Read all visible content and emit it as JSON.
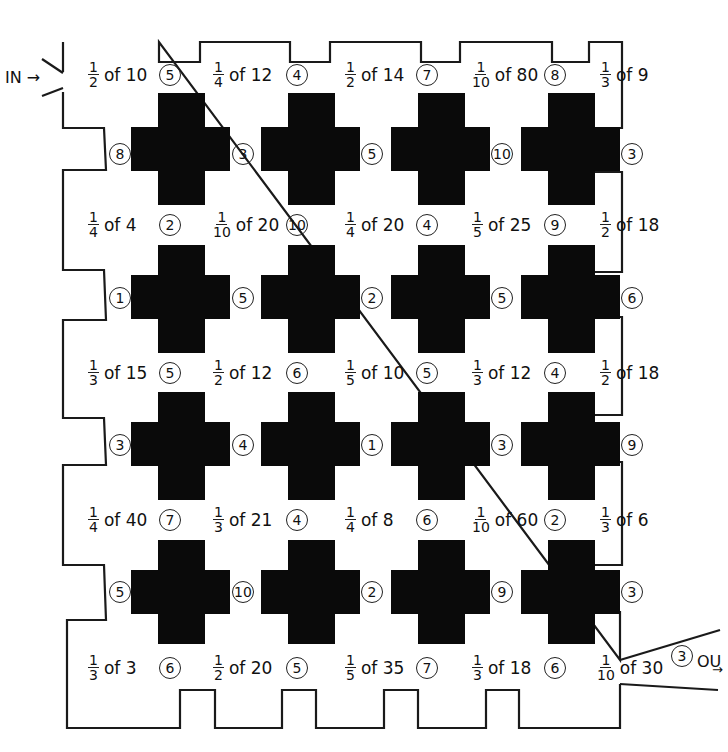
{
  "puzzle": {
    "entry_label": "IN →",
    "exit_label": "OU",
    "exit_arrow": "→",
    "fraction_rows": [
      [
        {
          "num": "1",
          "den": "2",
          "of": "of 10"
        },
        {
          "num": "1",
          "den": "4",
          "of": "of 12"
        },
        {
          "num": "1",
          "den": "2",
          "of": "of 14"
        },
        {
          "num": "1",
          "den": "10",
          "of": "of 80"
        },
        {
          "num": "1",
          "den": "3",
          "of": "of 9"
        }
      ],
      [
        {
          "num": "1",
          "den": "4",
          "of": "of 4"
        },
        {
          "num": "1",
          "den": "10",
          "of": "of 20"
        },
        {
          "num": "1",
          "den": "4",
          "of": "of 20"
        },
        {
          "num": "1",
          "den": "5",
          "of": "of 25"
        },
        {
          "num": "1",
          "den": "2",
          "of": "of 18"
        }
      ],
      [
        {
          "num": "1",
          "den": "3",
          "of": "of 15"
        },
        {
          "num": "1",
          "den": "2",
          "of": "of 12"
        },
        {
          "num": "1",
          "den": "5",
          "of": "of 10"
        },
        {
          "num": "1",
          "den": "3",
          "of": "of 12"
        },
        {
          "num": "1",
          "den": "2",
          "of": "of 18"
        }
      ],
      [
        {
          "num": "1",
          "den": "4",
          "of": "of 40"
        },
        {
          "num": "1",
          "den": "3",
          "of": "of 21"
        },
        {
          "num": "1",
          "den": "4",
          "of": "of 8"
        },
        {
          "num": "1",
          "den": "10",
          "of": "of 60"
        },
        {
          "num": "1",
          "den": "3",
          "of": "of 6"
        }
      ],
      [
        {
          "num": "1",
          "den": "3",
          "of": "of 3"
        },
        {
          "num": "1",
          "den": "2",
          "of": "of 20"
        },
        {
          "num": "1",
          "den": "5",
          "of": "of 35"
        },
        {
          "num": "1",
          "den": "3",
          "of": "of 18"
        },
        {
          "num": "1",
          "den": "10",
          "of": "of 30"
        }
      ]
    ],
    "horizontal_circles": [
      [
        "5",
        "4",
        "7",
        "8"
      ],
      [
        "2",
        "10",
        "4",
        "9"
      ],
      [
        "5",
        "6",
        "5",
        "4"
      ],
      [
        "7",
        "4",
        "6",
        "2"
      ],
      [
        "6",
        "5",
        "7",
        "6",
        "3"
      ]
    ],
    "vertical_circles": [
      [
        "8",
        "3",
        "5",
        "10",
        "3"
      ],
      [
        "1",
        "5",
        "2",
        "5",
        "6"
      ],
      [
        "3",
        "4",
        "1",
        "3",
        "9"
      ],
      [
        "5",
        "10",
        "2",
        "9",
        "3"
      ]
    ]
  }
}
